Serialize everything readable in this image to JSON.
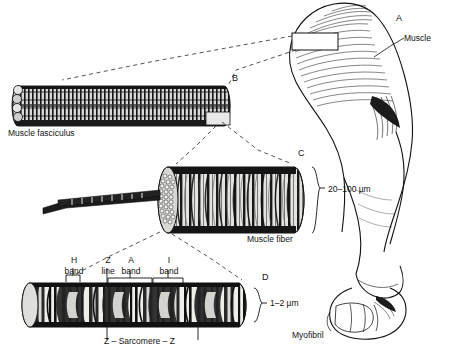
{
  "figure": {
    "background": "#ffffff",
    "ink": "#000000"
  },
  "panels": {
    "a": {
      "letter": "A",
      "callout": "Muscle",
      "caption": "",
      "description": "arm-with-biceps-muscle"
    },
    "b": {
      "letter": "B",
      "caption": "Muscle fasciculus",
      "description": "bundle-of-muscle-fibers"
    },
    "c": {
      "letter": "C",
      "caption": "Muscle fiber",
      "dimension": "20–100 µm",
      "description": "single-striated-muscle-fiber-cut-end"
    },
    "d": {
      "letter": "D",
      "caption": "Myofibril",
      "dimension": "1–2 µm",
      "description": "myofibril-with-sarcomere-banding"
    }
  },
  "bands": [
    {
      "name": "H",
      "sub": "band"
    },
    {
      "name": "Z",
      "sub": "line"
    },
    {
      "name": "A",
      "sub": "band"
    },
    {
      "name": "I",
      "sub": "band"
    }
  ],
  "sarcomere_label": "Z – Sarcomere – Z"
}
